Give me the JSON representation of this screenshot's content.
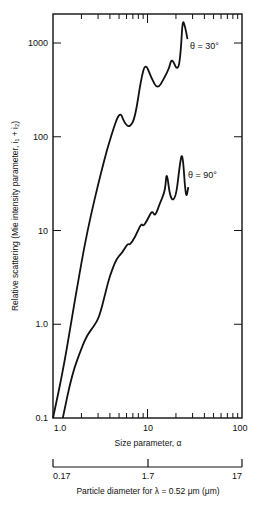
{
  "chart_data": {
    "type": "line",
    "title": "",
    "xlabel": "Size parameter, α",
    "ylabel": "Relative scattering (Mie intensity parameter, i₁ + i₂)",
    "xscale": "log",
    "yscale": "log",
    "xlim": [
      1,
      100
    ],
    "ylim": [
      0.1,
      2000
    ],
    "x_tick_labels": [
      "1.0",
      "10",
      "100"
    ],
    "x_ticks": [
      1,
      10,
      100
    ],
    "y_tick_labels": [
      "0.1",
      "1.0",
      "10",
      "100",
      "1000"
    ],
    "y_ticks": [
      0.1,
      1,
      10,
      100,
      1000
    ],
    "grid": false,
    "legend": "none (inline annotations)",
    "secondary_x_axis": {
      "label": "Particle diameter for λ = 0.52 μm (μm)",
      "tick_labels": [
        "0.17",
        "1.7",
        "17"
      ],
      "ticks": [
        0.17,
        1.7,
        17
      ]
    },
    "series": [
      {
        "name": "θ = 30°",
        "annotation": "θ = 30°",
        "points": [
          [
            1.0,
            0.1
          ],
          [
            1.3,
            0.35
          ],
          [
            1.7,
            1.8
          ],
          [
            2.3,
            10
          ],
          [
            3.3,
            46
          ],
          [
            4.2,
            110
          ],
          [
            5.1,
            190
          ],
          [
            5.7,
            140
          ],
          [
            6.5,
            125
          ],
          [
            7.4,
            160
          ],
          [
            8.5,
            400
          ],
          [
            9.5,
            620
          ],
          [
            11.0,
            420
          ],
          [
            12.8,
            320
          ],
          [
            15.0,
            420
          ],
          [
            17.0,
            540
          ],
          [
            18.0,
            700
          ],
          [
            21.0,
            490
          ],
          [
            22.5,
            800
          ],
          [
            23.5,
            1800
          ],
          [
            25.0,
            1500
          ],
          [
            26.5,
            1100
          ]
        ]
      },
      {
        "name": "θ = 90°",
        "annotation": "θ = 90°",
        "points": [
          [
            1.27,
            0.1
          ],
          [
            1.6,
            0.3
          ],
          [
            2.0,
            0.55
          ],
          [
            2.3,
            0.77
          ],
          [
            2.7,
            0.95
          ],
          [
            3.1,
            1.2
          ],
          [
            3.6,
            2.2
          ],
          [
            4.0,
            3.3
          ],
          [
            4.7,
            5.0
          ],
          [
            5.4,
            5.8
          ],
          [
            6.2,
            7.3
          ],
          [
            6.5,
            7.0
          ],
          [
            7.4,
            8.5
          ],
          [
            8.6,
            12
          ],
          [
            9.0,
            11
          ],
          [
            10.0,
            13
          ],
          [
            11.2,
            16.5
          ],
          [
            12.0,
            14
          ],
          [
            13.5,
            19.5
          ],
          [
            15.0,
            25
          ],
          [
            15.5,
            30
          ],
          [
            16.0,
            43
          ],
          [
            17.5,
            21
          ],
          [
            20.0,
            22
          ],
          [
            22.0,
            52
          ],
          [
            23.5,
            70
          ],
          [
            25.5,
            21
          ],
          [
            27.0,
            29
          ]
        ]
      }
    ]
  },
  "plot_frame": {
    "left_px": 53,
    "right_px": 242,
    "top_px": 14,
    "bottom_px": 418
  },
  "labels": {
    "y_axis_title": "Relative scattering (Mie intensity parameter, i₁ + i₂)",
    "x_axis_title": "Size parameter, α",
    "secondary_axis_title": "Particle diameter for λ = 0.52 μm (μm)",
    "annotation_30": "θ = 30°",
    "annotation_90": "θ = 90°",
    "y_ticks": [
      "1000",
      "100",
      "10",
      "1.0",
      "0.1"
    ],
    "x_ticks": [
      "1.0",
      "10",
      "100"
    ],
    "secondary_ticks": [
      "0.17",
      "1.7",
      "17"
    ]
  },
  "colors": {
    "line": "#111111",
    "background": "#ffffff"
  }
}
